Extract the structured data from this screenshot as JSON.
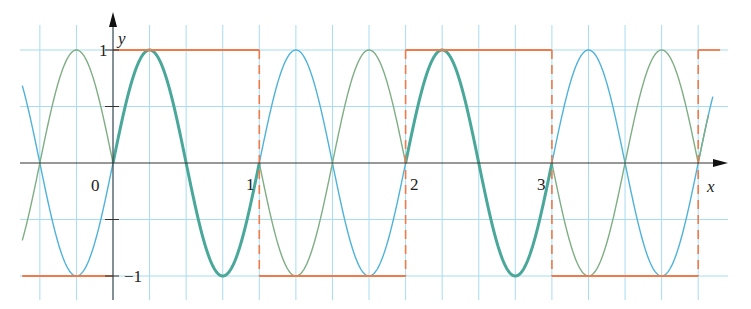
{
  "chart_data": {
    "type": "line",
    "title": "",
    "xlabel": "x",
    "ylabel": "y",
    "xlim": [
      -0.62,
      4.15
    ],
    "ylim": [
      -1.2,
      1.25
    ],
    "grid": true,
    "grid_step_x": 0.25,
    "grid_step_y": 0.5,
    "x_ticks": [
      {
        "value": 0,
        "label": "0"
      },
      {
        "value": 1,
        "label": "1"
      },
      {
        "value": 2,
        "label": "2"
      },
      {
        "value": 3,
        "label": "3"
      }
    ],
    "y_ticks": [
      {
        "value": 1,
        "label": "1"
      },
      {
        "value": 0.5,
        "label": ""
      },
      {
        "value": -0.5,
        "label": ""
      },
      {
        "value": -1,
        "label": "−1"
      }
    ],
    "series": [
      {
        "name": "square wave",
        "style": "step, dashed verticals",
        "color": "#f07a4a",
        "segments": [
          {
            "x": [
              -0.62,
              0
            ],
            "y": -1
          },
          {
            "x": [
              0,
              1
            ],
            "y": 1
          },
          {
            "x": [
              1,
              2
            ],
            "y": -1
          },
          {
            "x": [
              2,
              3
            ],
            "y": 1
          },
          {
            "x": [
              3,
              4
            ],
            "y": -1
          },
          {
            "x": [
              4,
              4.15
            ],
            "y": 1
          }
        ],
        "jumps_x": [
          0,
          1,
          2,
          3,
          4
        ]
      },
      {
        "name": "sin(2πx)",
        "color": "#4fb3d9",
        "function": "sin(2*pi*x)",
        "x_range": [
          -0.62,
          4.1
        ],
        "peaks_x": [
          0.25,
          1.25,
          2.25,
          3.25
        ],
        "troughs_x": [
          -0.25,
          0.75,
          1.75,
          2.75,
          3.75
        ]
      },
      {
        "name": "square(x)·sin(2πx)",
        "color": "#7fae84",
        "function": "square(x)*sin(2*pi*x)",
        "x_range": [
          -0.62,
          4.1
        ],
        "peaks_x": [
          -0.25,
          0.25,
          1.75,
          2.25,
          3.75
        ],
        "troughs_x": [
          0.75,
          1.25,
          2.75,
          3.25
        ]
      }
    ],
    "annotations": [
      "Curves coincide (thick teal) where square wave = +1"
    ]
  },
  "axes": {
    "x_label": "x",
    "y_label": "y",
    "origin_label": "0",
    "y_top_label": "1",
    "y_bottom_label": "−1",
    "x_labels": [
      "1",
      "2",
      "3"
    ]
  },
  "colors": {
    "grid": "#a8dcef",
    "axis": "#333333",
    "square": "#f07a4a",
    "sine": "#4fb3d9",
    "product": "#7fae84",
    "overlap": "#4aa89a"
  }
}
